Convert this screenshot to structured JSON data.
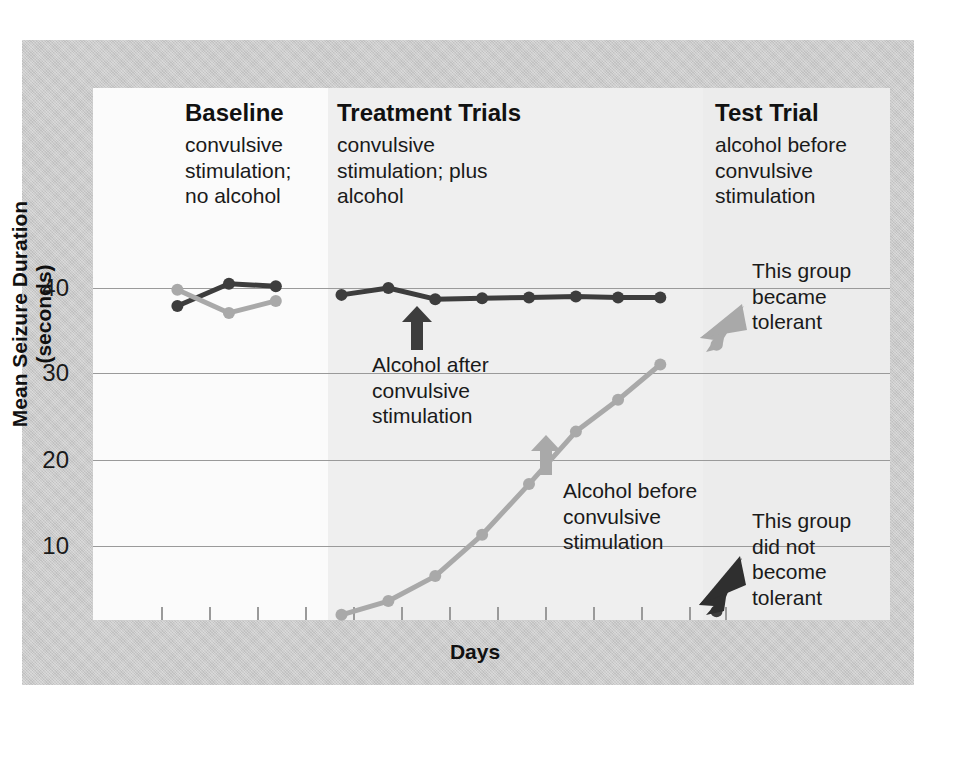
{
  "chart_data": {
    "type": "line",
    "title": "",
    "xlabel": "Days",
    "ylabel": "Mean Seizure Duration (seconds)",
    "ylim": [
      0,
      44
    ],
    "yticks": [
      10,
      20,
      30,
      40
    ],
    "ytick_labels": [
      "10",
      "20",
      "30",
      "40"
    ],
    "grid": "horizontal",
    "legend": "none",
    "xlim": [
      0,
      17
    ],
    "x_tick_count": 16,
    "phases": [
      {
        "name": "Baseline",
        "x_start": 0,
        "x_end": 4.7
      },
      {
        "name": "Treatment Trials",
        "x_start": 4.7,
        "x_end": 12.2
      },
      {
        "name": "Test Trial",
        "x_start": 12.2,
        "x_end": 16
      }
    ],
    "series": [
      {
        "name": "Alcohol after convulsive stimulation",
        "color": "#3d3d3d",
        "baseline_x": [
          1.8,
          2.9,
          3.9
        ],
        "baseline_y": [
          37.9,
          40.5,
          40.2
        ],
        "treatment_x": [
          5.3,
          6.3,
          7.3,
          8.3,
          9.3,
          10.3,
          11.2,
          12.1
        ],
        "treatment_y": [
          39.2,
          40.0,
          38.7,
          38.8,
          38.9,
          39.0,
          38.9,
          38.9
        ],
        "test_x": [
          13.3
        ],
        "test_y": [
          2.4
        ]
      },
      {
        "name": "Alcohol before convulsive stimulation",
        "color": "#a9a9a9",
        "baseline_x": [
          1.8,
          2.9,
          3.9
        ],
        "baseline_y": [
          39.8,
          37.1,
          38.5
        ],
        "treatment_x": [
          5.3,
          6.3,
          7.3,
          8.3,
          9.3,
          10.3,
          11.2,
          12.1
        ],
        "treatment_y": [
          2.0,
          3.6,
          6.5,
          11.3,
          17.2,
          23.3,
          27.0,
          31.1
        ],
        "test_x": [
          13.3
        ],
        "test_y": [
          33.4
        ]
      }
    ]
  },
  "axes": {
    "y_title": "Mean Seizure Duration (seconds)",
    "x_title": "Days",
    "y_ticks": [
      "40",
      "30",
      "20",
      "10"
    ]
  },
  "columns": [
    {
      "heading": "Baseline",
      "line1": "convulsive",
      "line2": "stimulation;",
      "line3": "no alcohol"
    },
    {
      "heading": "Treatment Trials",
      "line1": "convulsive",
      "line2": "stimulation; plus",
      "line3": "alcohol"
    },
    {
      "heading": "Test Trial",
      "line1": "alcohol before",
      "line2": "convulsive",
      "line3": "stimulation"
    }
  ],
  "annotations": {
    "dark_arrow_label": {
      "line1": "Alcohol after",
      "line2": "convulsive",
      "line3": "stimulation"
    },
    "gray_arrow_label": {
      "line1": "Alcohol before",
      "line2": "convulsive",
      "line3": "stimulation"
    },
    "tolerant_note": {
      "line1": "This group",
      "line2": "became",
      "line3": "tolerant"
    },
    "not_tolerant_note": {
      "line1": "This group",
      "line2": "did not",
      "line3": "become",
      "line4": "tolerant"
    }
  },
  "colors": {
    "dark_series": "#3d3d3d",
    "light_series": "#a9a9a9",
    "frame": "#c9c9c9",
    "gridline": "#9a9a9a"
  }
}
